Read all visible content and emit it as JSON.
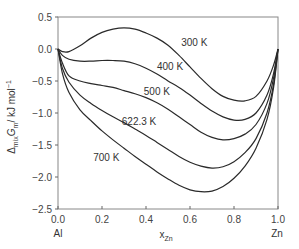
{
  "chart_data": {
    "type": "line",
    "title": "",
    "xlabel": "x_Zn",
    "ylabel": "Δmix Gm / kJ mol⁻¹",
    "xlim": [
      0.0,
      1.0
    ],
    "ylim": [
      -2.5,
      0.5
    ],
    "grid": false,
    "legend_position": "inline labels",
    "x_ticks": [
      "0.0",
      "0.2",
      "0.4",
      "0.6",
      "0.8",
      "1.0"
    ],
    "y_ticks": [
      "0.5",
      "0.0",
      "−0.5",
      "−1.0",
      "−1.5",
      "−2.0",
      "−2.5"
    ],
    "x_end_labels": {
      "left": "Al",
      "right": "Zn"
    },
    "x": [
      0.0,
      0.02,
      0.05,
      0.1,
      0.15,
      0.2,
      0.25,
      0.3,
      0.35,
      0.4,
      0.45,
      0.5,
      0.55,
      0.6,
      0.65,
      0.7,
      0.75,
      0.8,
      0.85,
      0.9,
      0.95,
      0.98,
      1.0
    ],
    "series": [
      {
        "name": "300 K",
        "values": [
          0.0,
          -0.04,
          -0.04,
          0.05,
          0.17,
          0.26,
          0.31,
          0.33,
          0.31,
          0.25,
          0.17,
          0.06,
          -0.1,
          -0.28,
          -0.46,
          -0.62,
          -0.74,
          -0.8,
          -0.81,
          -0.74,
          -0.5,
          -0.25,
          0.0
        ]
      },
      {
        "name": "400 K",
        "values": [
          0.0,
          -0.1,
          -0.16,
          -0.19,
          -0.19,
          -0.18,
          -0.18,
          -0.19,
          -0.23,
          -0.3,
          -0.39,
          -0.5,
          -0.6,
          -0.72,
          -0.85,
          -0.97,
          -1.06,
          -1.11,
          -1.1,
          -1.0,
          -0.72,
          -0.38,
          0.0
        ]
      },
      {
        "name": "500 K",
        "values": [
          0.0,
          -0.22,
          -0.42,
          -0.5,
          -0.54,
          -0.57,
          -0.6,
          -0.65,
          -0.7,
          -0.76,
          -0.84,
          -0.94,
          -1.06,
          -1.18,
          -1.3,
          -1.38,
          -1.42,
          -1.4,
          -1.33,
          -1.18,
          -0.85,
          -0.45,
          0.0
        ]
      },
      {
        "name": "622.3 K",
        "values": [
          0.0,
          -0.3,
          -0.52,
          -0.72,
          -0.85,
          -0.96,
          -1.06,
          -1.15,
          -1.25,
          -1.35,
          -1.46,
          -1.57,
          -1.68,
          -1.77,
          -1.83,
          -1.86,
          -1.84,
          -1.76,
          -1.62,
          -1.4,
          -1.0,
          -0.55,
          0.0
        ]
      },
      {
        "name": "700 K",
        "values": [
          0.0,
          -0.38,
          -0.68,
          -0.95,
          -1.12,
          -1.28,
          -1.42,
          -1.55,
          -1.68,
          -1.8,
          -1.92,
          -2.03,
          -2.13,
          -2.2,
          -2.23,
          -2.22,
          -2.15,
          -2.02,
          -1.83,
          -1.55,
          -1.1,
          -0.6,
          0.0
        ]
      }
    ],
    "annotations": [
      {
        "text": "300 K",
        "x": 0.56,
        "y": 0.1
      },
      {
        "text": "400 K",
        "x": 0.45,
        "y": -0.28
      },
      {
        "text": "500 K",
        "x": 0.39,
        "y": -0.67
      },
      {
        "text": "622.3 K",
        "x": 0.29,
        "y": -1.13
      },
      {
        "text": "700 K",
        "x": 0.16,
        "y": -1.7
      }
    ]
  },
  "labels": {
    "ylabel_main": "Δ",
    "ylabel_sub1": "mix",
    "ylabel_G": "G",
    "ylabel_sub2": "m",
    "ylabel_unit": "/ kJ mol",
    "ylabel_sup": "−1",
    "xlabel_main": "x",
    "xlabel_sub": "Zn",
    "x_left_end": "Al",
    "x_right_end": "Zn"
  }
}
